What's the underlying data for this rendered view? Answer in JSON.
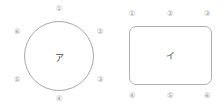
{
  "background_color": "#ffffff",
  "stroke_color": "#a8a8a8",
  "label_color": "#4a4a4a",
  "callout_color": "#9a9a9a",
  "figures": [
    {
      "id": "figure-a",
      "shape": "circle",
      "center_label": "ア",
      "callouts": [
        {
          "label": "①",
          "position": "top",
          "x": 59,
          "y": 9
        },
        {
          "label": "②",
          "position": "upper-right",
          "x": 100,
          "y": 32
        },
        {
          "label": "③",
          "position": "lower-right",
          "x": 100,
          "y": 80
        },
        {
          "label": "④",
          "position": "bottom",
          "x": 59,
          "y": 99
        },
        {
          "label": "⑤",
          "position": "lower-left",
          "x": 17,
          "y": 80
        },
        {
          "label": "⑥",
          "position": "upper-left",
          "x": 17,
          "y": 32
        }
      ]
    },
    {
      "id": "figure-i",
      "shape": "rounded-rectangle",
      "center_label": "イ",
      "callouts": [
        {
          "label": "①",
          "position": "top-left",
          "x": 21,
          "y": 14
        },
        {
          "label": "②",
          "position": "top-center",
          "x": 59,
          "y": 14
        },
        {
          "label": "③",
          "position": "top-right",
          "x": 96,
          "y": 14
        },
        {
          "label": "④",
          "position": "bottom-left",
          "x": 21,
          "y": 96
        },
        {
          "label": "⑤",
          "position": "bottom-center",
          "x": 59,
          "y": 96
        },
        {
          "label": "⑥",
          "position": "bottom-right",
          "x": 96,
          "y": 96
        }
      ]
    }
  ]
}
